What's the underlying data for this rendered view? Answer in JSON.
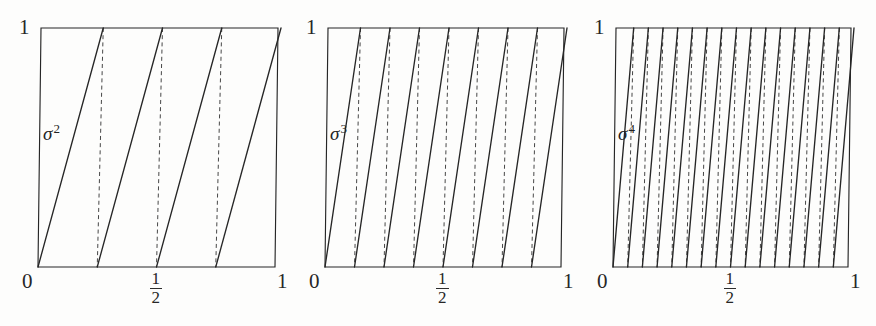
{
  "figure": {
    "caption": "",
    "background": "#fdfdfc",
    "ink": "#262626"
  },
  "chart_data": {
    "type": "line",
    "title": "",
    "xlabel": "",
    "ylabel": "",
    "xlim": [
      0,
      1
    ],
    "ylim": [
      0,
      1
    ],
    "grid": false,
    "legend": null,
    "panels": [
      {
        "id": "panel-sigma-2",
        "label": "σ",
        "exponent": "2",
        "branches": 4,
        "x_ticks": [
          {
            "value": 0,
            "text": "0",
            "kind": "plain"
          },
          {
            "value": 0.5,
            "text": "1/2",
            "kind": "fraction",
            "numerator": "1",
            "denominator": "2"
          },
          {
            "value": 1,
            "text": "1",
            "kind": "plain"
          }
        ],
        "y_ticks": [
          {
            "value": 1,
            "text": "1",
            "kind": "plain"
          }
        ],
        "segments": [
          {
            "x0": 0.0,
            "y0": 0,
            "x1": 0.25,
            "y1": 1
          },
          {
            "x0": 0.25,
            "y0": 0,
            "x1": 0.5,
            "y1": 1
          },
          {
            "x0": 0.5,
            "y0": 0,
            "x1": 0.75,
            "y1": 1
          },
          {
            "x0": 0.75,
            "y0": 0,
            "x1": 1.0,
            "y1": 1
          }
        ],
        "dashed_drops": [
          0.25,
          0.5,
          0.75
        ]
      },
      {
        "id": "panel-sigma-3",
        "label": "σ",
        "exponent": "3",
        "branches": 8,
        "x_ticks": [
          {
            "value": 0,
            "text": "0",
            "kind": "plain"
          },
          {
            "value": 0.5,
            "text": "1/2",
            "kind": "fraction",
            "numerator": "1",
            "denominator": "2"
          },
          {
            "value": 1,
            "text": "1",
            "kind": "plain"
          }
        ],
        "y_ticks": [
          {
            "value": 1,
            "text": "1",
            "kind": "plain"
          }
        ],
        "segments": [
          {
            "x0": 0.0,
            "y0": 0,
            "x1": 0.125,
            "y1": 1
          },
          {
            "x0": 0.125,
            "y0": 0,
            "x1": 0.25,
            "y1": 1
          },
          {
            "x0": 0.25,
            "y0": 0,
            "x1": 0.375,
            "y1": 1
          },
          {
            "x0": 0.375,
            "y0": 0,
            "x1": 0.5,
            "y1": 1
          },
          {
            "x0": 0.5,
            "y0": 0,
            "x1": 0.625,
            "y1": 1
          },
          {
            "x0": 0.625,
            "y0": 0,
            "x1": 0.75,
            "y1": 1
          },
          {
            "x0": 0.75,
            "y0": 0,
            "x1": 0.875,
            "y1": 1
          },
          {
            "x0": 0.875,
            "y0": 0,
            "x1": 1.0,
            "y1": 1
          }
        ],
        "dashed_drops": [
          0.125,
          0.25,
          0.375,
          0.5,
          0.625,
          0.75,
          0.875
        ]
      },
      {
        "id": "panel-sigma-4",
        "label": "σ",
        "exponent": "4",
        "branches": 16,
        "x_ticks": [
          {
            "value": 0,
            "text": "0",
            "kind": "plain"
          },
          {
            "value": 0.5,
            "text": "1/2",
            "kind": "fraction",
            "numerator": "1",
            "denominator": "2"
          },
          {
            "value": 1,
            "text": "1",
            "kind": "plain"
          }
        ],
        "y_ticks": [
          {
            "value": 1,
            "text": "1",
            "kind": "plain"
          }
        ],
        "segments": [
          {
            "x0": 0.0,
            "y0": 0,
            "x1": 0.0625,
            "y1": 1
          },
          {
            "x0": 0.0625,
            "y0": 0,
            "x1": 0.125,
            "y1": 1
          },
          {
            "x0": 0.125,
            "y0": 0,
            "x1": 0.1875,
            "y1": 1
          },
          {
            "x0": 0.1875,
            "y0": 0,
            "x1": 0.25,
            "y1": 1
          },
          {
            "x0": 0.25,
            "y0": 0,
            "x1": 0.3125,
            "y1": 1
          },
          {
            "x0": 0.3125,
            "y0": 0,
            "x1": 0.375,
            "y1": 1
          },
          {
            "x0": 0.375,
            "y0": 0,
            "x1": 0.4375,
            "y1": 1
          },
          {
            "x0": 0.4375,
            "y0": 0,
            "x1": 0.5,
            "y1": 1
          },
          {
            "x0": 0.5,
            "y0": 0,
            "x1": 0.5625,
            "y1": 1
          },
          {
            "x0": 0.5625,
            "y0": 0,
            "x1": 0.625,
            "y1": 1
          },
          {
            "x0": 0.625,
            "y0": 0,
            "x1": 0.6875,
            "y1": 1
          },
          {
            "x0": 0.6875,
            "y0": 0,
            "x1": 0.75,
            "y1": 1
          },
          {
            "x0": 0.75,
            "y0": 0,
            "x1": 0.8125,
            "y1": 1
          },
          {
            "x0": 0.8125,
            "y0": 0,
            "x1": 0.875,
            "y1": 1
          },
          {
            "x0": 0.875,
            "y0": 0,
            "x1": 0.9375,
            "y1": 1
          },
          {
            "x0": 0.9375,
            "y0": 0,
            "x1": 1.0,
            "y1": 1
          }
        ],
        "dashed_drops": [
          0.0625,
          0.125,
          0.1875,
          0.25,
          0.3125,
          0.375,
          0.4375,
          0.5,
          0.5625,
          0.625,
          0.6875,
          0.75,
          0.8125,
          0.875,
          0.9375
        ]
      }
    ]
  },
  "geometry": {
    "panel_boxes": [
      {
        "left": 38,
        "top": 28,
        "width": 237,
        "height": 239
      },
      {
        "left": 325,
        "top": 28,
        "width": 236,
        "height": 239
      },
      {
        "left": 613,
        "top": 28,
        "width": 235,
        "height": 239
      }
    ]
  }
}
